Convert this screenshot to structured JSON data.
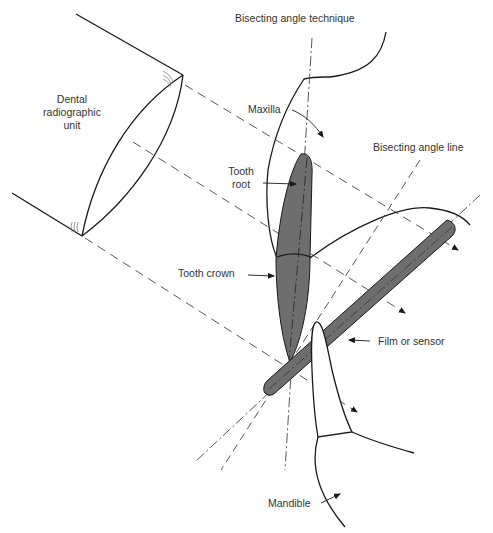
{
  "title": "Bisecting angle technique",
  "labels": {
    "unit": [
      "Dental",
      "radiographic",
      "unit"
    ],
    "maxilla": "Maxilla",
    "bisecting_line": "Bisecting angle line",
    "tooth_root": [
      "Tooth",
      "root"
    ],
    "tooth_crown": "Tooth crown",
    "film": "Film or sensor",
    "mandible": "Mandible"
  },
  "colors": {
    "line": "#1a1a1a",
    "tooth_fill": "#6e6e6e",
    "film_fill": "#6e6e6e",
    "text": "#333333"
  }
}
